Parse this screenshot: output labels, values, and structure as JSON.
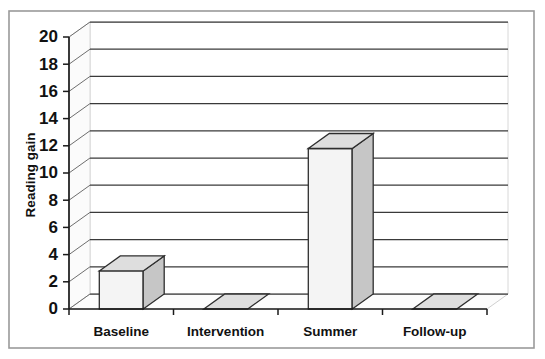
{
  "chart_data": {
    "type": "bar",
    "title": "",
    "subtitle": "",
    "xlabel": "",
    "ylabel": "Reading gain",
    "categories": [
      "Baseline",
      "Intervention",
      "Summer",
      "Follow-up"
    ],
    "values": [
      2.8,
      0,
      11.8,
      0
    ],
    "series": [
      {
        "name": "Reading gain",
        "values": [
          2.8,
          0,
          11.8,
          0
        ]
      }
    ],
    "ylim": [
      0,
      20
    ],
    "ytick_step": 2,
    "yticks": [
      0,
      2,
      4,
      6,
      8,
      10,
      12,
      14,
      16,
      18,
      20
    ],
    "ytick_labels": [
      "0",
      "2",
      "4",
      "6",
      "8",
      "10",
      "12",
      "14",
      "16",
      "18",
      "20"
    ],
    "grid": true,
    "grid_axis": "y",
    "legend": false,
    "legend_position": "none",
    "style": "3d-column",
    "annotations": []
  },
  "colors": {
    "bar_front": "#f4f4f4",
    "bar_side": "#c6c6c6",
    "bar_top": "#dedede",
    "bar_edge": "#2e2e2e",
    "gridline": "#3a3a3a",
    "axis": "#1a1a1a",
    "frame": "#9a9a9a",
    "background": "#ffffff",
    "text": "#111111"
  }
}
